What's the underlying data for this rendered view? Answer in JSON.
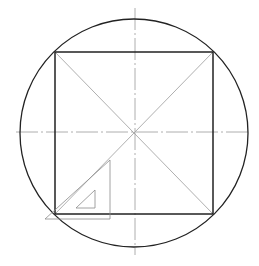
{
  "diagram": {
    "colors": {
      "background": "#ffffff",
      "outline": "#222222",
      "construction": "#9a9a9a",
      "setsquare": "#8a8a8a"
    },
    "circle": {
      "cx": 134,
      "cy": 133,
      "r": 114
    },
    "square": {
      "x1": 55,
      "y1": 52,
      "x2": 213,
      "y2": 214
    },
    "center_lines": {
      "vertical": {
        "x": 135,
        "y1": 8,
        "y2": 255
      },
      "horizontal": {
        "y": 132,
        "x1": 16,
        "x2": 249
      }
    },
    "set_square": {
      "outer": [
        [
          45,
          219
        ],
        [
          110,
          219
        ],
        [
          110,
          160
        ]
      ],
      "inner": [
        [
          76,
          208
        ],
        [
          95,
          208
        ],
        [
          95,
          190
        ]
      ]
    }
  }
}
